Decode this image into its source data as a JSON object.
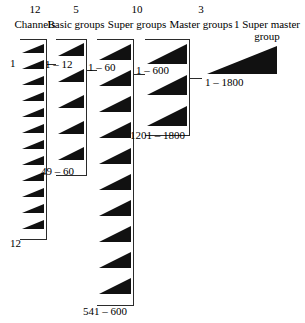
{
  "diagram": {
    "columns": [
      {
        "id": "channels",
        "count_label": "12",
        "title": "Channels",
        "triangle_count": 12,
        "top_range": "1",
        "bottom_range": "12"
      },
      {
        "id": "basic-groups",
        "count_label": "5",
        "title": "Basic groups",
        "triangle_count": 5,
        "top_range": "1 – 12",
        "bottom_range": "49 – 60"
      },
      {
        "id": "super-groups",
        "count_label": "10",
        "title": "Super groups",
        "triangle_count": 10,
        "top_range": "1 – 60",
        "bottom_range": "541 – 600"
      },
      {
        "id": "master-groups",
        "count_label": "3",
        "title": "Master groups",
        "triangle_count": 3,
        "top_range": "1 – 600",
        "bottom_range": "1201 – 1800"
      },
      {
        "id": "super-master-group",
        "count_label": "",
        "title": "1 Super master group",
        "triangle_count": 1,
        "top_range": "1 – 1800",
        "bottom_range": ""
      }
    ]
  }
}
